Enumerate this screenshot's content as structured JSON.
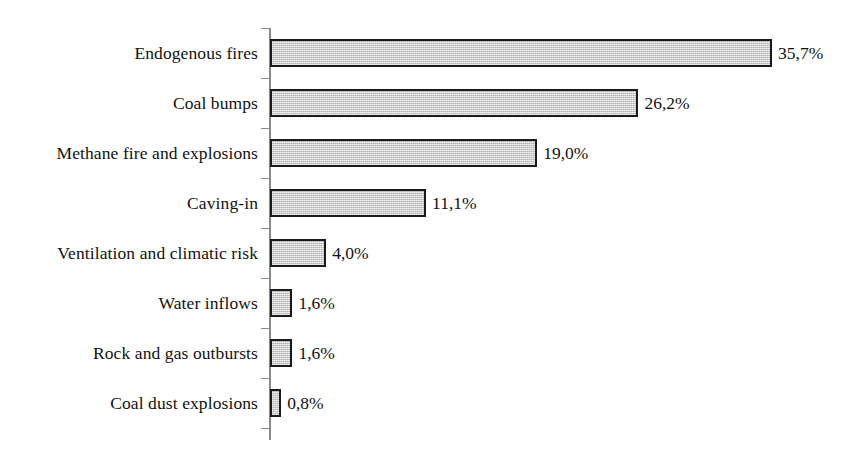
{
  "chart_data": {
    "type": "bar",
    "orientation": "horizontal",
    "title": "",
    "subtitle": "",
    "xlabel": "",
    "ylabel": "",
    "grid": false,
    "legend": null,
    "legend_position": "none",
    "value_suffix": "%",
    "decimal_separator": ",",
    "xlim": [
      0,
      35.7
    ],
    "axis": {
      "category_axis_visible": true,
      "value_axis_visible": false,
      "tick_marks": true,
      "tick_labels": false
    },
    "colors": {
      "bar_fill": "#c9c9c9",
      "bar_border": "#1a1a1a",
      "axis": "#8a8a8a",
      "text": "#111111",
      "background": "#ffffff"
    },
    "categories": [
      "Endogenous fires",
      "Coal bumps",
      "Methane fire and explosions",
      "Caving-in",
      "Ventilation and climatic risk",
      "Water inflows",
      "Rock and gas outbursts",
      "Coal dust explosions"
    ],
    "values": [
      35.7,
      26.2,
      19.0,
      11.1,
      4.0,
      1.6,
      1.6,
      0.8
    ],
    "data_labels": [
      "35,7%",
      "26,2%",
      "19,0%",
      "11,1%",
      "4,0%",
      "1,6%",
      "1,6%",
      "0,8%"
    ],
    "points": [
      {
        "category": "Endogenous fires",
        "value": 35.7,
        "label": "35,7%"
      },
      {
        "category": "Coal bumps",
        "value": 26.2,
        "label": "26,2%"
      },
      {
        "category": "Methane fire and explosions",
        "value": 19.0,
        "label": "19,0%"
      },
      {
        "category": "Caving-in",
        "value": 11.1,
        "label": "11,1%"
      },
      {
        "category": "Ventilation and climatic risk",
        "value": 4.0,
        "label": "4,0%"
      },
      {
        "category": "Water inflows",
        "value": 1.6,
        "label": "1,6%"
      },
      {
        "category": "Rock and gas outbursts",
        "value": 1.6,
        "label": "1,6%"
      },
      {
        "category": "Coal dust explosions",
        "value": 0.8,
        "label": "0,8%"
      }
    ]
  }
}
